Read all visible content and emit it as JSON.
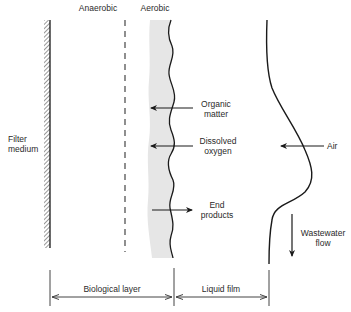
{
  "diagram": {
    "zones": {
      "anaerobic": "Anaerobic",
      "aerobic": "Aerobic"
    },
    "filter_medium": {
      "line1": "Filter",
      "line2": "medium"
    },
    "fluxes": {
      "organic_matter": {
        "line1": "Organic",
        "line2": "matter",
        "direction": "into biofilm"
      },
      "dissolved_oxygen": {
        "line1": "Dissolved",
        "line2": "oxygen",
        "direction": "into biofilm"
      },
      "end_products": {
        "line1": "End",
        "line2": "products",
        "direction": "out of biofilm"
      },
      "air": {
        "label": "Air",
        "direction": "into liquid film"
      }
    },
    "flow": {
      "line1": "Wastewater",
      "line2": "flow",
      "direction": "down"
    },
    "dimensions": {
      "biological_layer": "Biological layer",
      "liquid_film": "Liquid film"
    },
    "colors": {
      "line": "#1a1a1a",
      "aerobic_fill": "#e6e6e6",
      "dimension_line": "#444444"
    }
  }
}
